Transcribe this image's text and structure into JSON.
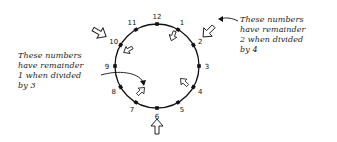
{
  "diagram": {
    "type": "clock-face",
    "numbers": [
      "12",
      "1",
      "2",
      "3",
      "4",
      "5",
      "6",
      "7",
      "8",
      "9",
      "10",
      "11"
    ],
    "center": [
      157,
      66
    ],
    "radius": 42,
    "line_color": "#111111"
  },
  "annotations": {
    "left": {
      "text": "These numbers\nhave remainder\n1 when divided\nby 3",
      "points_to": "inner arrows",
      "highlighted_numbers": [
        "1",
        "4",
        "7",
        "10"
      ]
    },
    "right": {
      "text": "These numbers\nhave remainder\n2 when divided\nby 4",
      "points_to": "outer arrows",
      "highlighted_numbers": [
        "2",
        "6",
        "10"
      ]
    }
  }
}
